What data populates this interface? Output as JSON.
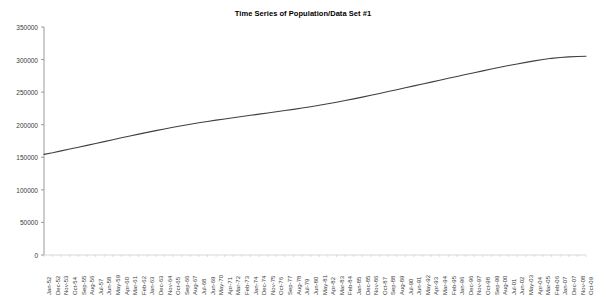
{
  "chart_data": {
    "type": "line",
    "title": "Time Series of Population/Data Set #1",
    "xlabel": "",
    "ylabel": "",
    "ylim": [
      0,
      350000
    ],
    "ytick_labels": [
      "350000",
      "300000",
      "250000",
      "200000",
      "150000",
      "100000",
      "50000",
      "0"
    ],
    "ytick_values": [
      350000,
      300000,
      250000,
      200000,
      150000,
      100000,
      50000,
      0
    ],
    "grid": false,
    "legend": "none",
    "line_color": "#3f3f3f",
    "axis_color": "#9a9a9a",
    "categories": [
      "Jan-52",
      "Dec-52",
      "Nov-53",
      "Oct-54",
      "Sep-55",
      "Aug-56",
      "Jul-57",
      "Jun-58",
      "May-59",
      "Apr-60",
      "Mar-61",
      "Feb-62",
      "Jan-63",
      "Dec-63",
      "Nov-64",
      "Oct-65",
      "Sep-66",
      "Aug-67",
      "Jul-68",
      "Jun-69",
      "May-70",
      "Apr-71",
      "Mar-72",
      "Feb-73",
      "Jan-74",
      "Dec-74",
      "Nov-75",
      "Oct-76",
      "Sep-77",
      "Aug-78",
      "Jul-79",
      "Jun-80",
      "May-81",
      "Apr-82",
      "Mar-83",
      "Feb-84",
      "Jan-85",
      "Dec-85",
      "Nov-86",
      "Oct-87",
      "Sep-88",
      "Aug-89",
      "Jul-90",
      "Jun-91",
      "May-92",
      "Apr-93",
      "Mar-94",
      "Feb-95",
      "Jan-96",
      "Dec-96",
      "Nov-97",
      "Oct-98",
      "Sep-99",
      "Aug-00",
      "Jul-01",
      "Jun-02",
      "May-03",
      "Apr-04",
      "Mar-05",
      "Feb-06",
      "Jan-07",
      "Dec-07",
      "Nov-08",
      "Oct-09"
    ],
    "values": [
      154500,
      157000,
      159800,
      162600,
      165400,
      168300,
      171200,
      174100,
      177000,
      179900,
      182700,
      185500,
      188200,
      190900,
      193500,
      196000,
      198400,
      200700,
      202900,
      205000,
      207000,
      208900,
      210800,
      212600,
      214400,
      216200,
      218000,
      219800,
      221700,
      223600,
      225600,
      227700,
      229900,
      232200,
      234600,
      237100,
      239700,
      242400,
      245200,
      248000,
      250900,
      253800,
      256700,
      259600,
      262500,
      265400,
      268300,
      271200,
      274100,
      277000,
      279900,
      282700,
      285500,
      288200,
      290800,
      293300,
      295700,
      298000,
      300100,
      301900,
      303200,
      304100,
      304700,
      305100
    ]
  }
}
